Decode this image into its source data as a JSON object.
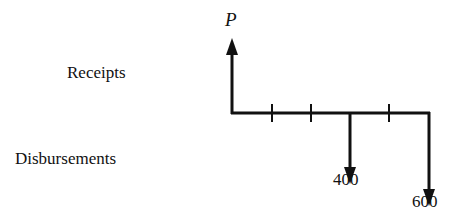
{
  "diagram": {
    "type": "cash-flow-diagram",
    "row_labels": {
      "receipts": "Receipts",
      "disbursements": "Disbursements"
    },
    "periods": 5,
    "flows": [
      {
        "period": 0,
        "direction": "up",
        "label": "P"
      },
      {
        "period": 3,
        "direction": "down",
        "label": "400"
      },
      {
        "period": 5,
        "direction": "down",
        "label": "600"
      }
    ],
    "colors": {
      "ink": "#111111",
      "background": "#ffffff"
    }
  }
}
